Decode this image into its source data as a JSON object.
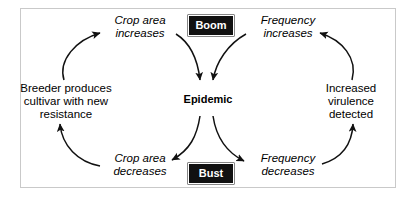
{
  "diagram": {
    "type": "cycle",
    "frame": {
      "border_color": "#c9c9c9"
    },
    "center": {
      "id": "epidemic",
      "label": "Epidemic",
      "style": "bold"
    },
    "badges": [
      {
        "id": "boom",
        "label": "Boom",
        "background": "#111111",
        "text_color": "#ffffff",
        "position": "top-center"
      },
      {
        "id": "bust",
        "label": "Bust",
        "background": "#111111",
        "text_color": "#ffffff",
        "position": "bottom-center"
      }
    ],
    "nodes": [
      {
        "id": "crop-area-increases",
        "label": "Crop area\nincreases",
        "style": "italic",
        "position": "top-left"
      },
      {
        "id": "frequency-increases",
        "label": "Frequency\nincreases",
        "style": "italic",
        "position": "top-right"
      },
      {
        "id": "breeder-produces-cultivar",
        "label": "Breeder produces\ncultivar with new\nresistance",
        "style": "upright",
        "position": "left"
      },
      {
        "id": "increased-virulence",
        "label": "Increased\nvirulence\ndetected",
        "style": "upright",
        "position": "right"
      },
      {
        "id": "crop-area-decreases",
        "label": "Crop area\ndecreases",
        "style": "italic",
        "position": "bottom-left"
      },
      {
        "id": "frequency-decreases",
        "label": "Frequency\ndecreases",
        "style": "italic",
        "position": "bottom-right"
      }
    ],
    "arrows": [
      {
        "id": "arrow-breeder-to-crop-increases",
        "from": "breeder-produces-cultivar",
        "to": "crop-area-increases",
        "direction": "up-right"
      },
      {
        "id": "arrow-crop-increases-to-epidemic",
        "from": "crop-area-increases",
        "to": "epidemic",
        "direction": "down-right"
      },
      {
        "id": "arrow-frequency-increases-to-epidemic",
        "from": "frequency-increases",
        "to": "epidemic",
        "direction": "down-left"
      },
      {
        "id": "arrow-virulence-to-frequency-increases",
        "from": "increased-virulence",
        "to": "frequency-increases",
        "direction": "up-left"
      },
      {
        "id": "arrow-epidemic-to-crop-decreases",
        "from": "epidemic",
        "to": "crop-area-decreases",
        "direction": "down-left"
      },
      {
        "id": "arrow-epidemic-to-frequency-decreases",
        "from": "epidemic",
        "to": "frequency-decreases",
        "direction": "down-right"
      },
      {
        "id": "arrow-crop-decreases-to-breeder",
        "from": "crop-area-decreases",
        "to": "breeder-produces-cultivar",
        "direction": "up-left"
      },
      {
        "id": "arrow-frequency-decreases-to-virulence",
        "from": "frequency-decreases",
        "to": "increased-virulence",
        "direction": "up-right"
      }
    ]
  }
}
